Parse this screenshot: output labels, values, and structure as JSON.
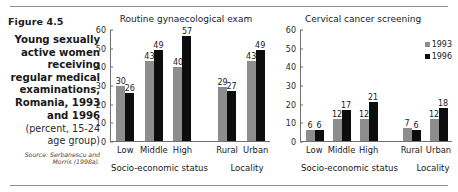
{
  "figure": {
    "number": "Figure 4.5",
    "title": "Young sexually active women receiving regular medical examinations, Romania, 1993 and 1996",
    "subtitle": "(percent, 15-24 age group)",
    "source": "Source: Serbanescu and Morris (1998a)."
  },
  "legend": {
    "items": [
      {
        "label": "1993",
        "color": "#8d8d8d"
      },
      {
        "label": "1996",
        "color": "#0d0d0d"
      }
    ]
  },
  "chart_data": [
    {
      "type": "bar",
      "title": "Routine gynaecological exam",
      "xlabel": "",
      "ylabel": "",
      "ylim": [
        0,
        60
      ],
      "yticks": [
        "0",
        "10",
        "20",
        "30",
        "40",
        "50",
        "60"
      ],
      "grid": false,
      "legend_position": "right-outside",
      "categories": [
        "Low",
        "Middle",
        "High",
        "Rural",
        "Urban"
      ],
      "category_groups": [
        {
          "label": "Socio-economic status",
          "categories": [
            "Low",
            "Middle",
            "High"
          ]
        },
        {
          "label": "Locality",
          "categories": [
            "Rural",
            "Urban"
          ]
        }
      ],
      "series": [
        {
          "name": "1993",
          "values": [
            30,
            43,
            40,
            29,
            43
          ]
        },
        {
          "name": "1996",
          "values": [
            26,
            49,
            57,
            27,
            49
          ]
        }
      ]
    },
    {
      "type": "bar",
      "title": "Cervical cancer screening",
      "xlabel": "",
      "ylabel": "",
      "ylim": [
        0,
        60
      ],
      "yticks": [
        "0",
        "10",
        "20",
        "30",
        "40",
        "50",
        "60"
      ],
      "grid": false,
      "legend_position": "right-outside",
      "categories": [
        "Low",
        "Middle",
        "High",
        "Rural",
        "Urban"
      ],
      "category_groups": [
        {
          "label": "Socio-economic status",
          "categories": [
            "Low",
            "Middle",
            "High"
          ]
        },
        {
          "label": "Locality",
          "categories": [
            "Rural",
            "Urban"
          ]
        }
      ],
      "series": [
        {
          "name": "1993",
          "values": [
            6,
            12,
            12,
            7,
            12
          ]
        },
        {
          "name": "1996",
          "values": [
            6,
            17,
            21,
            6,
            18
          ]
        }
      ]
    }
  ]
}
